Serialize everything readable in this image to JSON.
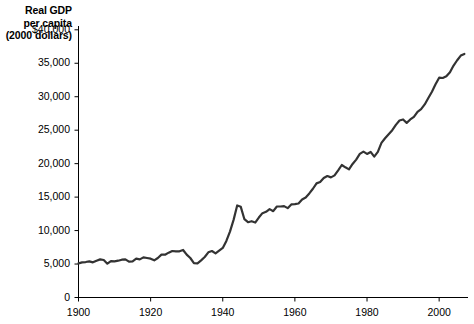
{
  "chart_data": {
    "type": "line",
    "title": "",
    "subtitle": "",
    "ylabel_lines": [
      "Real GDP",
      "per capita",
      "(2000 dollars)"
    ],
    "ylabel": "Real GDP per capita (2000 dollars)",
    "xlabel": "",
    "xlim": [
      1900,
      2008
    ],
    "ylim": [
      0,
      40000
    ],
    "grid": false,
    "legend": false,
    "legend_position": "none",
    "line_color": "#333333",
    "line_width": 2.2,
    "axis_color": "#000000",
    "background_color": "#ffffff",
    "ytick_labels": [
      "0",
      "5,000",
      "10,000",
      "15,000",
      "20,000",
      "25,000",
      "30,000",
      "35,000",
      "$40,000"
    ],
    "ytick_values": [
      0,
      5000,
      10000,
      15000,
      20000,
      25000,
      30000,
      35000,
      40000
    ],
    "xtick_labels": [
      "1900",
      "1920",
      "1940",
      "1960",
      "1980",
      "2000"
    ],
    "xtick_values": [
      1900,
      1920,
      1940,
      1960,
      1980,
      2000
    ],
    "series_name": "Real GDP per capita",
    "x": [
      1900,
      1901,
      1902,
      1903,
      1904,
      1905,
      1906,
      1907,
      1908,
      1909,
      1910,
      1911,
      1912,
      1913,
      1914,
      1915,
      1916,
      1917,
      1918,
      1919,
      1920,
      1921,
      1922,
      1923,
      1924,
      1925,
      1926,
      1927,
      1928,
      1929,
      1930,
      1931,
      1932,
      1933,
      1934,
      1935,
      1936,
      1937,
      1938,
      1939,
      1940,
      1941,
      1942,
      1943,
      1944,
      1945,
      1946,
      1947,
      1948,
      1949,
      1950,
      1951,
      1952,
      1953,
      1954,
      1955,
      1956,
      1957,
      1958,
      1959,
      1960,
      1961,
      1962,
      1963,
      1964,
      1965,
      1966,
      1967,
      1968,
      1969,
      1970,
      1971,
      1972,
      1973,
      1974,
      1975,
      1976,
      1977,
      1978,
      1979,
      1980,
      1981,
      1982,
      1983,
      1984,
      1985,
      1986,
      1987,
      1988,
      1989,
      1990,
      1991,
      1992,
      1993,
      1994,
      1995,
      1996,
      1997,
      1998,
      1999,
      2000,
      2001,
      2002,
      2003,
      2004,
      2005,
      2006,
      2007
    ],
    "values": [
      5100,
      5250,
      5300,
      5400,
      5250,
      5500,
      5700,
      5600,
      5050,
      5450,
      5400,
      5500,
      5650,
      5700,
      5350,
      5400,
      5800,
      5700,
      6000,
      5900,
      5800,
      5550,
      5900,
      6400,
      6400,
      6700,
      6950,
      6900,
      6900,
      7100,
      6400,
      5900,
      5150,
      5100,
      5550,
      6050,
      6750,
      6950,
      6600,
      7000,
      7400,
      8450,
      9850,
      11600,
      13750,
      13550,
      11700,
      11250,
      11400,
      11200,
      11950,
      12600,
      12800,
      13200,
      12900,
      13600,
      13600,
      13650,
      13350,
      13900,
      13950,
      14050,
      14650,
      14950,
      15550,
      16250,
      17050,
      17250,
      17850,
      18150,
      17950,
      18250,
      19000,
      19800,
      19450,
      19150,
      19950,
      20600,
      21450,
      21800,
      21450,
      21750,
      21050,
      21750,
      23100,
      23800,
      24400,
      25000,
      25800,
      26450,
      26600,
      26100,
      26600,
      27000,
      27750,
      28150,
      28850,
      29800,
      30750,
      31850,
      32850,
      32800,
      33050,
      33650,
      34650,
      35450,
      36150,
      36400
    ]
  },
  "axes": {
    "y_axis_name": "real-gdp-per-capita-axis",
    "x_axis_name": "year-axis"
  }
}
